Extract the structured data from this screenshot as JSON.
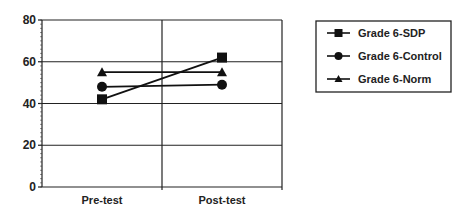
{
  "chart_data": {
    "type": "line",
    "title": "",
    "xlabel": "",
    "ylabel": "",
    "categories": [
      "Pre-test",
      "Post-test"
    ],
    "series": [
      {
        "name": "Grade 6-SDP",
        "marker": "square",
        "values": [
          42,
          62
        ]
      },
      {
        "name": "Grade 6-Control",
        "marker": "circle",
        "values": [
          48,
          49
        ]
      },
      {
        "name": "Grade 6-Norm",
        "marker": "triangle",
        "values": [
          55,
          55
        ]
      }
    ],
    "ylim": [
      0,
      80
    ],
    "yticks": [
      0,
      20,
      40,
      60,
      80
    ],
    "grid": true,
    "legend_position": "right"
  }
}
